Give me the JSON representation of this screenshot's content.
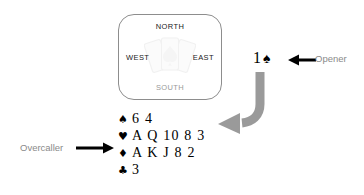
{
  "compass": {
    "north": "NORTH",
    "west": "WEST",
    "east": "EAST",
    "south": "SOUTH",
    "watermark_icon": "card-fan-icon"
  },
  "opener": {
    "bid_level": "1",
    "bid_suit": "♠",
    "label": "Opener",
    "arrow_icon": "arrow-left-icon"
  },
  "action_arrow": {
    "icon": "curved-arrow-down-left-icon",
    "color": "#9a9a9a"
  },
  "overcaller": {
    "label": "Overcaller",
    "arrow_icon": "arrow-right-icon",
    "hand": [
      {
        "suit_icon": "spade-icon",
        "suit": "♠",
        "cards": "6 4"
      },
      {
        "suit_icon": "heart-icon",
        "suit": "♥",
        "cards": "A Q 10 8 3"
      },
      {
        "suit_icon": "diamond-icon",
        "suit": "♦",
        "cards": "A K J 8 2"
      },
      {
        "suit_icon": "club-icon",
        "suit": "♣",
        "cards": "3"
      }
    ]
  },
  "colors": {
    "text_dark": "#000000",
    "text_gray": "#8a8a8a",
    "box_border": "#8d8d8d",
    "arrow_gray": "#9a9a9a"
  }
}
